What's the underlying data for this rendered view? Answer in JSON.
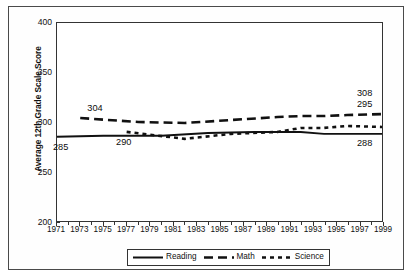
{
  "chart_data": {
    "type": "line",
    "title": "",
    "xlabel": "",
    "ylabel": "Average 12th Grade Scale Score",
    "ylim": [
      200,
      400
    ],
    "yticks": [
      200,
      250,
      300,
      350,
      400
    ],
    "xlim": [
      1971,
      1999
    ],
    "xticks": [
      1971,
      1973,
      1975,
      1977,
      1979,
      1981,
      1983,
      1985,
      1987,
      1989,
      1991,
      1993,
      1995,
      1997,
      1999
    ],
    "grid": false,
    "legend_position": "bottom-center",
    "legend": [
      "Reading",
      "Math",
      "Science"
    ],
    "annotations": [
      {
        "text": "304",
        "series": "Math",
        "x": 1973,
        "y": 304,
        "position": "above-left"
      },
      {
        "text": "285",
        "series": "Reading",
        "x": 1971,
        "y": 285,
        "position": "below-left"
      },
      {
        "text": "290",
        "series": "Science",
        "x": 1977,
        "y": 290,
        "position": "below"
      },
      {
        "text": "308",
        "series": "Math",
        "x": 1999,
        "y": 308,
        "position": "above-right"
      },
      {
        "text": "295",
        "series": "Science",
        "x": 1999,
        "y": 295,
        "position": "above-right"
      },
      {
        "text": "288",
        "series": "Reading",
        "x": 1999,
        "y": 288,
        "position": "below-right"
      }
    ],
    "series": [
      {
        "name": "Reading",
        "style": "solid",
        "color": "#111111",
        "x": [
          1971,
          1975,
          1980,
          1984,
          1988,
          1990,
          1992,
          1994,
          1996,
          1999
        ],
        "values": [
          285,
          286,
          286,
          289,
          290,
          290,
          290,
          288,
          288,
          288
        ]
      },
      {
        "name": "Math",
        "style": "dashed",
        "color": "#111111",
        "x": [
          1973,
          1978,
          1982,
          1986,
          1990,
          1992,
          1994,
          1996,
          1999
        ],
        "values": [
          304,
          300,
          299,
          302,
          305,
          306,
          306,
          307,
          308
        ]
      },
      {
        "name": "Science",
        "style": "dotted",
        "color": "#111111",
        "x": [
          1977,
          1982,
          1986,
          1990,
          1992,
          1994,
          1996,
          1999
        ],
        "values": [
          290,
          283,
          288,
          290,
          294,
          294,
          296,
          295
        ]
      }
    ]
  }
}
